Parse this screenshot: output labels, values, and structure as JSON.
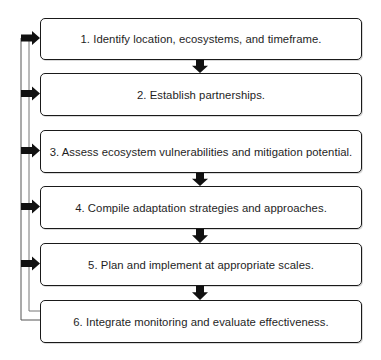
{
  "diagram": {
    "type": "flowchart",
    "colors": {
      "box_border": "#1a1a1a",
      "arrow": "#111111",
      "feedback_line": "#444444",
      "text": "#1e1e1e",
      "background": "#ffffff"
    },
    "steps": [
      {
        "id": 1,
        "label": "1. Identify location, ecosystems, and timeframe.",
        "top": 18,
        "height": 42
      },
      {
        "id": 2,
        "label": "2. Establish partnerships.",
        "top": 73,
        "height": 43
      },
      {
        "id": 3,
        "label": "3. Assess ecosystem vulnerabilities and mitigation potential.",
        "top": 130,
        "height": 43
      },
      {
        "id": 4,
        "label": "4. Compile adaptation strategies and approaches.",
        "top": 186,
        "height": 43
      },
      {
        "id": 5,
        "label": "5. Plan and implement at appropriate scales.",
        "top": 243,
        "height": 43
      },
      {
        "id": 6,
        "label": "6. Integrate monitoring and evaluate effectiveness.",
        "top": 300,
        "height": 43
      }
    ],
    "down_arrows_between": [
      [
        1,
        2
      ],
      [
        3,
        4
      ],
      [
        4,
        5
      ],
      [
        5,
        6
      ]
    ],
    "feedback_arrows_into": [
      1,
      2,
      3,
      4,
      5
    ],
    "feedback_loop_from": 6
  }
}
